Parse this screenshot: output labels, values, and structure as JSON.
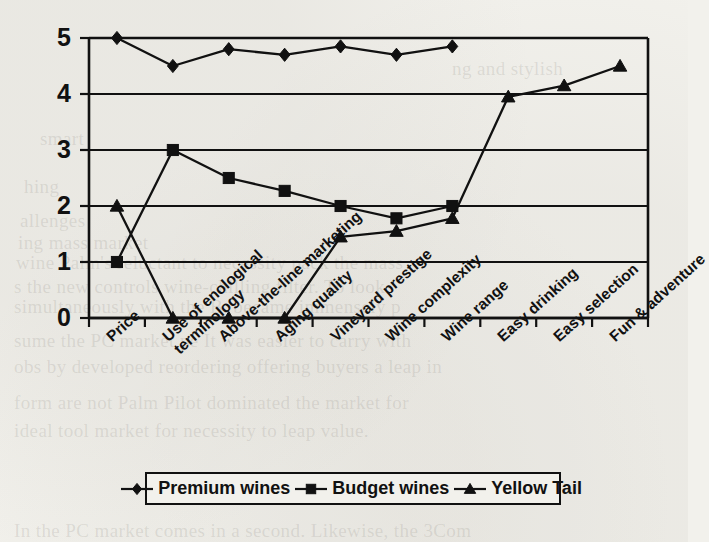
{
  "page": {
    "background_color": "#f2f1ec",
    "ink_color": "#111111"
  },
  "bleed_through_text": [
    {
      "text": "ng and stylish",
      "x": 452,
      "y": 58
    },
    {
      "text": "smart",
      "x": 40,
      "y": 128
    },
    {
      "text": "hing",
      "x": 24,
      "y": 176
    },
    {
      "text": "allenges",
      "x": 20,
      "y": 210
    },
    {
      "text": "ing mass market",
      "x": 18,
      "y": 232
    },
    {
      "text": "wine Palm's reluctant to necessity pack the mass",
      "x": 16,
      "y": 252
    },
    {
      "text": "s the new controls wine-chilling filter. To look",
      "x": 14,
      "y": 276
    },
    {
      "text": "simultaneously with the B. became immensely p",
      "x": 14,
      "y": 296
    },
    {
      "text": "sume  the  PC  market  pe  It  was  easier  to  carry  with",
      "x": 14,
      "y": 330
    },
    {
      "text": "obs  by  developed  reordering  offering  buyers  a  leap  in",
      "x": 14,
      "y": 356
    },
    {
      "text": "form  are  not  Palm  Pilot  dominated  the  market  for",
      "x": 14,
      "y": 392
    },
    {
      "text": "ideal  tool  market  for  necessity  to  leap  value.",
      "x": 14,
      "y": 420
    },
    {
      "text": "In  the  PC  market  comes  in  a  second.  Likewise,  the  3Com",
      "x": 14,
      "y": 520
    }
  ],
  "chart_data": {
    "type": "line",
    "title": "",
    "xlabel": "",
    "ylabel": "",
    "ylim": [
      0,
      5
    ],
    "yticks": [
      0,
      1,
      2,
      3,
      4,
      5
    ],
    "grid": true,
    "legend_position": "bottom",
    "categories": [
      "Price",
      "Use of enological terminology",
      "Above-the-line marketing",
      "Aging quality",
      "Vineyard prestige",
      "Wine complexity",
      "Wine range",
      "Easy drinking",
      "Easy selection",
      "Fun & adventure"
    ],
    "category_lines": [
      [
        "Price"
      ],
      [
        "Use of enological",
        "terminology"
      ],
      [
        "Above-the-line marketing"
      ],
      [
        "Aging quality"
      ],
      [
        "Vineyard prestige"
      ],
      [
        "Wine complexity"
      ],
      [
        "Wine range"
      ],
      [
        "Easy drinking"
      ],
      [
        "Easy selection"
      ],
      [
        "Fun & adventure"
      ]
    ],
    "series": [
      {
        "name": "Premium wines",
        "marker": "diamond",
        "values": [
          5,
          4.5,
          4.8,
          4.7,
          4.85,
          4.7,
          4.85,
          null,
          null,
          null
        ]
      },
      {
        "name": "Budget wines",
        "marker": "square",
        "values": [
          1,
          3,
          2.5,
          2.27,
          2,
          1.78,
          2,
          null,
          null,
          null
        ]
      },
      {
        "name": "Yellow Tail",
        "marker": "triangle",
        "values": [
          2,
          0,
          0,
          0,
          1.45,
          1.55,
          1.78,
          3.95,
          4.15,
          4.5
        ]
      }
    ]
  },
  "legend": {
    "entries": [
      {
        "label": "Premium wines",
        "marker": "diamond"
      },
      {
        "label": "Budget wines",
        "marker": "square"
      },
      {
        "label": "Yellow Tail",
        "marker": "triangle"
      }
    ]
  },
  "axis_labels": {
    "y_tick_texts": [
      "5",
      "4",
      "3",
      "2",
      "1",
      "0"
    ]
  }
}
